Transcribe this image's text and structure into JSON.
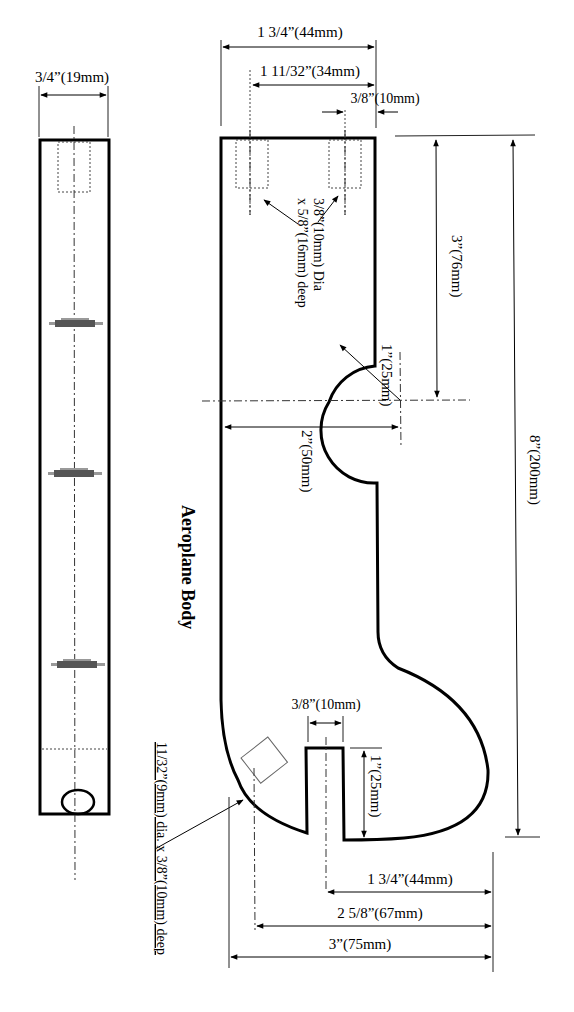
{
  "drawing": {
    "title": "Aeroplane Body",
    "side_view": {
      "width_label": "3/4”(19mm)"
    },
    "top_view": {
      "dims": {
        "overall_width": "1 3/4”(44mm)",
        "hole_spacing": "1 11/32”(34mm)",
        "hole_edge_offset": "3/8”(10mm)",
        "hole_note_line1": "3/8”(10mm) Dia",
        "hole_note_line2": "x 5/8”(16mm) deep",
        "arc_center_from_top": "3”(76mm)",
        "arc_radius": "1”(25mm)",
        "arc_center_depth": "2”(50mm)",
        "overall_length": "8”(200mm)",
        "slot_width": "3/8”(10mm)",
        "slot_depth": "1”(25mm)",
        "slot_center": "1 3/4”(44mm)",
        "angled_hole_position": "2 5/8”(67mm)",
        "overall_width_bottom": "3”(75mm)",
        "angled_hole_note": "11/32”(9mm) dia. x 3/8”(10mm) deep"
      }
    }
  }
}
